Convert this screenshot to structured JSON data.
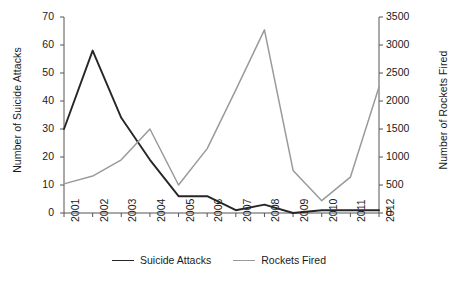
{
  "chart_data": {
    "type": "line",
    "title": "",
    "xlabel": "",
    "categories": [
      "2001",
      "2002",
      "2003",
      "2004",
      "2005",
      "2006",
      "2007",
      "2008",
      "2009",
      "2010",
      "2011",
      "2012"
    ],
    "grid": false,
    "legend_position": "bottom",
    "axes": {
      "left": {
        "label": "Number of Suicide Attacks",
        "ticks": [
          "0",
          "10",
          "20",
          "30",
          "40",
          "50",
          "60",
          "70"
        ],
        "tick_values": [
          0,
          10,
          20,
          30,
          40,
          50,
          60,
          70
        ],
        "ylim": [
          0,
          70
        ]
      },
      "right": {
        "label": "Number of Rockets Fired",
        "ticks": [
          "0",
          "500",
          "1000",
          "1500",
          "2000",
          "2500",
          "3000",
          "3500"
        ],
        "tick_values": [
          0,
          500,
          1000,
          1500,
          2000,
          2500,
          3000,
          3500
        ],
        "ylim": [
          0,
          3500
        ]
      }
    },
    "series": [
      {
        "name": "Suicide Attacks",
        "axis": "left",
        "color": "#262626",
        "width": 1.9,
        "values": [
          30,
          58,
          34,
          19,
          6,
          6,
          1,
          3,
          0,
          1,
          1,
          1
        ]
      },
      {
        "name": "Rockets Fired",
        "axis": "right",
        "color": "#9a9a9a",
        "width": 1.5,
        "values": [
          520,
          660,
          950,
          1500,
          500,
          1150,
          2200,
          3270,
          760,
          220,
          640,
          2250
        ]
      }
    ]
  },
  "legend": {
    "items": [
      {
        "label": "Suicide Attacks",
        "color": "#262626",
        "width": 1.9
      },
      {
        "label": "Rockets Fired",
        "color": "#9a9a9a",
        "width": 1.5
      }
    ]
  }
}
